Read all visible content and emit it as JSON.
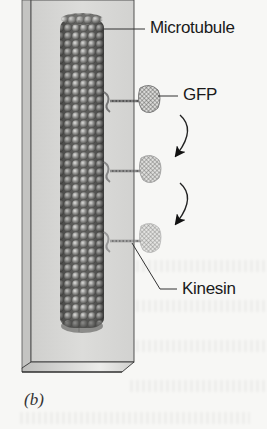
{
  "figure": {
    "panel_label": "(b)",
    "labels": {
      "microtubule": "Microtubule",
      "gfp": "GFP",
      "kinesin": "Kinesin"
    },
    "elements": {
      "slide": "glass-slide",
      "filament": "microtubule-filament",
      "motors": [
        "kinesin-gfp-1",
        "kinesin-gfp-2",
        "kinesin-gfp-3"
      ],
      "arrows": [
        "movement-arrow-1",
        "movement-arrow-2"
      ]
    },
    "colors": {
      "background": "#f7f7f5",
      "slide": "#d9d9d7",
      "microtubule": "#7d7d7b",
      "text": "#1a1a1a"
    }
  }
}
